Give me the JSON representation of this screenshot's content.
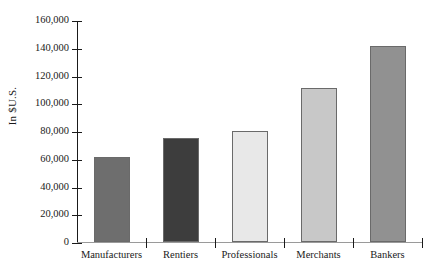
{
  "chart_data": {
    "type": "bar",
    "title": "",
    "xlabel": "",
    "ylabel": "In $U.S.",
    "categories": [
      "Manufacturers",
      "Rentiers",
      "Professionals",
      "Merchants",
      "Bankers"
    ],
    "values": [
      61000,
      75000,
      80000,
      111000,
      141000
    ],
    "ylim": [
      0,
      160000
    ],
    "ytick_values": [
      0,
      20000,
      40000,
      60000,
      80000,
      100000,
      120000,
      140000,
      160000
    ],
    "ytick_labels": [
      "0",
      "20,000",
      "40,000",
      "60,000",
      "80,000",
      "100,000",
      "120,000",
      "140,000",
      "160,000"
    ],
    "grid": false,
    "legend": false,
    "bar_colors": [
      "#6e6e6e",
      "#3d3d3d",
      "#e8e8e8",
      "#c8c8c8",
      "#919191"
    ],
    "bar_border_color": "#6a6a6a",
    "axis_color": "#1a1a1a",
    "baseline_color": "#9a9a9a",
    "background": "#ffffff"
  }
}
